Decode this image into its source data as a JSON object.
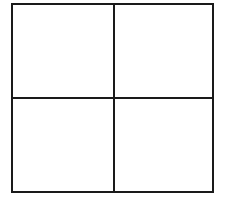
{
  "diagram": {
    "type": "grid",
    "rows": 2,
    "columns": 2,
    "cells": [
      {
        "row": 0,
        "col": 0,
        "label": ""
      },
      {
        "row": 0,
        "col": 1,
        "label": ""
      },
      {
        "row": 1,
        "col": 0,
        "label": ""
      },
      {
        "row": 1,
        "col": 1,
        "label": ""
      }
    ],
    "line_color": "#1a1a1a",
    "background_color": "#ffffff"
  }
}
